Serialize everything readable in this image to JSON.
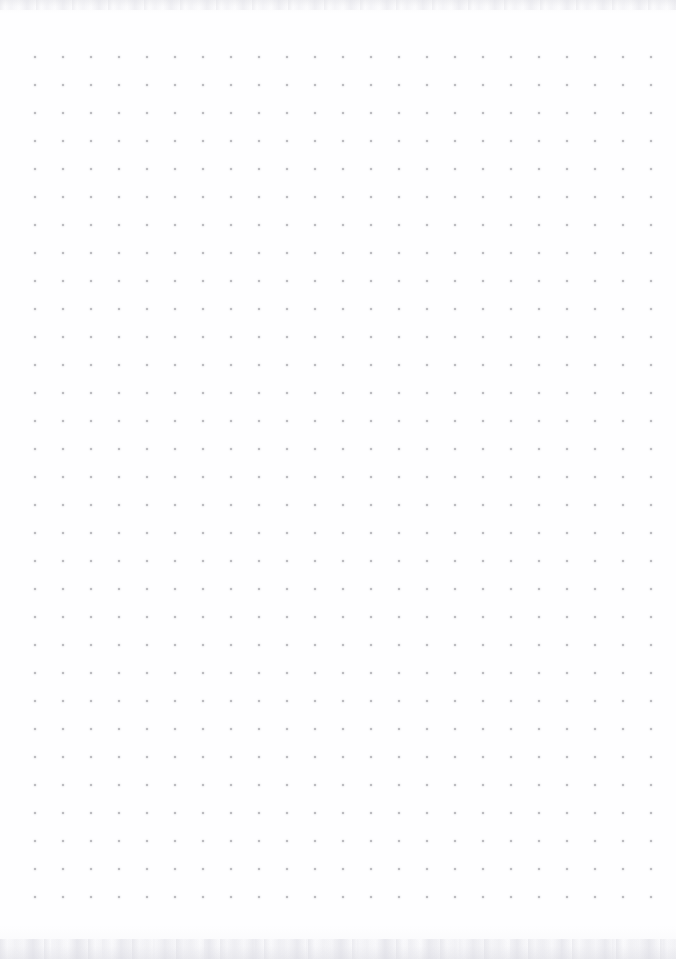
{
  "page": {
    "kind": "dot-grid-notebook-page",
    "width": 676,
    "height": 959,
    "background_color": "#fefeff",
    "has_text_content": false,
    "has_ui_chrome": false
  },
  "grid": {
    "label": "dot grid",
    "columns": 23,
    "rows": 31,
    "spacing_px": 28,
    "origin_x": 35,
    "origin_y": 57,
    "last_dot_x": 643,
    "last_dot_y": 897,
    "dot_diameter_px": 2,
    "dot_color": "#a9a9ae",
    "dot_opacity": 0.92
  },
  "texture": {
    "top_band_label": "paper scan texture top edge",
    "bottom_band_label": "paper scan texture bottom edge",
    "top_band_height": 14,
    "bottom_band_height": 34,
    "tint_color": "#e4e4e9"
  },
  "margins": {
    "left_px": 35,
    "right_px": 33,
    "top_px": 57,
    "bottom_px": 62
  }
}
